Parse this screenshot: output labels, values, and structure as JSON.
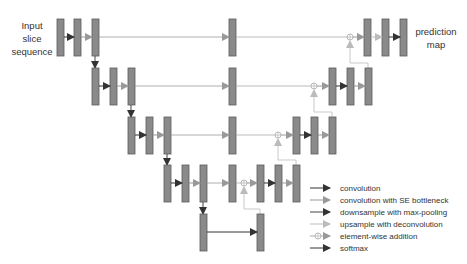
{
  "labels": {
    "input": [
      "Input",
      "slice",
      "sequence"
    ],
    "output": [
      "prediction",
      "map"
    ]
  },
  "legend": [
    {
      "label": "convolution",
      "color": "#333333",
      "type": "arrow"
    },
    {
      "label": "convolution with SE bottleneck",
      "color": "#999999",
      "type": "arrow"
    },
    {
      "label": "downsample with max-pooling",
      "color": "#444444",
      "type": "arrow"
    },
    {
      "label": "upsample with deconvolution",
      "color": "#bbbbbb",
      "type": "arrow"
    },
    {
      "label": "element-wise addition",
      "color": "#aaaaaa",
      "type": "circle-plus"
    },
    {
      "label": "softmax",
      "color": "#333333",
      "type": "arrow"
    }
  ],
  "colors": {
    "block_fill": "#8a8a8a",
    "block_stroke": "#5a5a5a",
    "conv": "#333333",
    "se_conv": "#999999",
    "upsample": "#bbbbbb",
    "skip": "#aaaaaa"
  }
}
